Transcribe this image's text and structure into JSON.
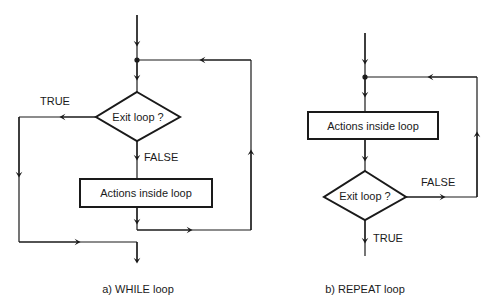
{
  "while_loop": {
    "caption": "a)  WHILE  loop",
    "decision": "Exit loop ?",
    "true_label": "TRUE",
    "false_label": "FALSE",
    "action": "Actions inside loop"
  },
  "repeat_loop": {
    "caption": "b)  REPEAT  loop",
    "decision": "Exit loop ?",
    "true_label": "TRUE",
    "false_label": "FALSE",
    "action": "Actions inside loop"
  },
  "colors": {
    "stroke": "#1a1a1a",
    "background": "#ffffff"
  }
}
